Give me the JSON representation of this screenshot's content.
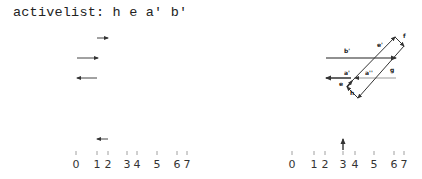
{
  "header": {
    "activelist_label": "activelist:",
    "activelist_items": [
      "h",
      "e",
      "a'",
      "b'"
    ],
    "activelist_text": "activelist: h e a' b'"
  },
  "left_panel": {
    "axis": {
      "ticks": [
        "0",
        "1",
        "2",
        "3",
        "4",
        "5",
        "6",
        "7"
      ]
    },
    "segments": [
      {
        "from": 1,
        "to": 2,
        "direction": "right",
        "row": 0
      },
      {
        "from": 0,
        "to": 1,
        "direction": "right",
        "row": 1
      },
      {
        "from": 0,
        "to": 1,
        "direction": "left",
        "row": 2
      },
      {
        "from": 1,
        "to": 2,
        "direction": "left",
        "row": "bottom"
      }
    ]
  },
  "right_panel": {
    "axis": {
      "ticks": [
        "0",
        "1",
        "2",
        "3",
        "4",
        "5",
        "6",
        "7"
      ],
      "sweep_marker": "3"
    },
    "edge_labels": [
      "b'",
      "e'",
      "f",
      "g",
      "a'",
      "a''",
      "e",
      "h"
    ]
  }
}
